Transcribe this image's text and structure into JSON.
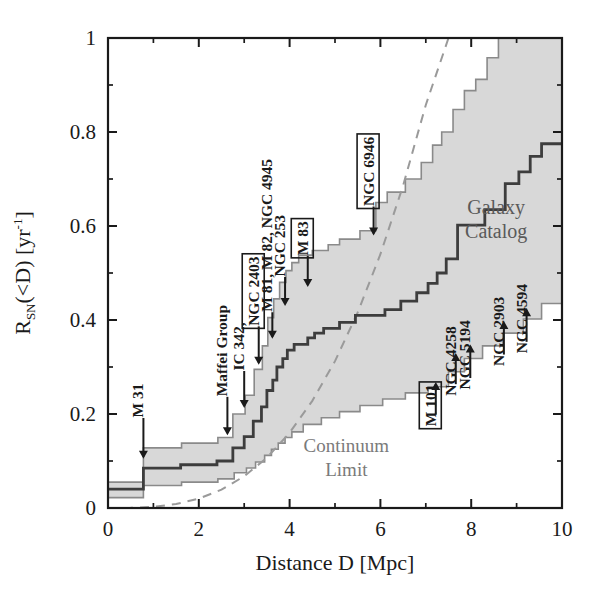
{
  "chart_data": {
    "type": "line",
    "title": "",
    "xlabel": "Distance D [Mpc]",
    "ylabel_parts": {
      "main": "R",
      "subscript": "SN",
      "arg": "(<D)",
      "units_pre": " [yr",
      "units_sup": "-1",
      "units_post": "]"
    },
    "ylabel": "R_SN(<D) [yr^-1]",
    "xlim": [
      0,
      10
    ],
    "ylim": [
      0,
      1
    ],
    "xticks": [
      0,
      2,
      4,
      6,
      8,
      10
    ],
    "xticklabels": [
      "0",
      "2",
      "4",
      "6",
      "8",
      "10"
    ],
    "xminor_step": 1,
    "yticks": [
      0,
      0.2,
      0.4,
      0.6,
      0.8,
      1
    ],
    "yticklabels": [
      "0",
      "0.2",
      "0.4",
      "0.6",
      "0.8",
      "1"
    ],
    "yminor_step": 0.1,
    "grid": false,
    "legend_position": "inline-annotation",
    "series": [
      {
        "name": "Galaxy Catalog",
        "style": "step",
        "color": "#3d3d3d",
        "x": [
          0.0,
          0.78,
          0.78,
          1.6,
          1.6,
          2.4,
          2.4,
          2.75,
          2.75,
          3.0,
          3.0,
          3.2,
          3.2,
          3.38,
          3.38,
          3.5,
          3.5,
          3.63,
          3.63,
          3.72,
          3.72,
          3.85,
          3.85,
          3.95,
          3.95,
          4.1,
          4.1,
          4.4,
          4.4,
          4.55,
          4.55,
          4.75,
          4.75,
          5.1,
          5.1,
          5.45,
          5.45,
          6.1,
          6.1,
          6.45,
          6.45,
          6.8,
          6.8,
          7.05,
          7.05,
          7.25,
          7.25,
          7.45,
          7.45,
          7.7,
          7.7,
          8.3,
          8.3,
          8.75,
          8.75,
          9.05,
          9.05,
          9.3,
          9.3,
          9.55,
          9.55,
          10.0
        ],
        "y": [
          0.04,
          0.04,
          0.085,
          0.085,
          0.092,
          0.092,
          0.1,
          0.1,
          0.128,
          0.128,
          0.152,
          0.152,
          0.185,
          0.185,
          0.215,
          0.215,
          0.25,
          0.25,
          0.272,
          0.272,
          0.3,
          0.3,
          0.318,
          0.318,
          0.336,
          0.336,
          0.348,
          0.348,
          0.362,
          0.362,
          0.372,
          0.372,
          0.382,
          0.382,
          0.395,
          0.395,
          0.41,
          0.41,
          0.422,
          0.422,
          0.44,
          0.44,
          0.458,
          0.458,
          0.478,
          0.478,
          0.5,
          0.5,
          0.53,
          0.53,
          0.602,
          0.602,
          0.635,
          0.635,
          0.69,
          0.69,
          0.715,
          0.715,
          0.748,
          0.748,
          0.775,
          0.775
        ]
      },
      {
        "name": "upper uncertainty bound",
        "style": "step",
        "color": "#8a8a8a",
        "x": [
          0.0,
          0.78,
          0.78,
          1.62,
          1.62,
          2.42,
          2.42,
          2.75,
          2.75,
          3.02,
          3.02,
          3.22,
          3.22,
          3.4,
          3.4,
          3.52,
          3.52,
          3.65,
          3.65,
          3.78,
          3.78,
          3.92,
          3.92,
          4.05,
          4.05,
          4.2,
          4.2,
          4.5,
          4.5,
          4.85,
          4.85,
          5.1,
          5.1,
          5.55,
          5.55,
          5.9,
          5.9,
          6.15,
          6.15,
          6.55,
          6.55,
          6.9,
          6.9,
          7.15,
          7.15,
          7.35,
          7.35,
          7.6,
          7.6,
          7.85,
          7.85,
          8.1,
          8.1,
          8.35,
          8.35,
          8.6,
          8.6,
          10.0
        ],
        "y": [
          0.055,
          0.055,
          0.128,
          0.128,
          0.138,
          0.138,
          0.15,
          0.15,
          0.2,
          0.2,
          0.24,
          0.24,
          0.295,
          0.295,
          0.345,
          0.345,
          0.405,
          0.405,
          0.445,
          0.445,
          0.48,
          0.48,
          0.505,
          0.505,
          0.522,
          0.522,
          0.538,
          0.538,
          0.548,
          0.548,
          0.56,
          0.56,
          0.572,
          0.572,
          0.59,
          0.59,
          0.65,
          0.65,
          0.672,
          0.672,
          0.7,
          0.7,
          0.735,
          0.735,
          0.772,
          0.772,
          0.8,
          0.8,
          0.848,
          0.848,
          0.888,
          0.888,
          0.912,
          0.912,
          0.958,
          0.958,
          1.0,
          1.0
        ]
      },
      {
        "name": "lower uncertainty bound",
        "style": "step",
        "color": "#8a8a8a",
        "x": [
          0.0,
          0.78,
          0.78,
          1.62,
          1.62,
          2.42,
          2.42,
          2.78,
          2.78,
          3.05,
          3.05,
          3.25,
          3.25,
          3.45,
          3.45,
          3.6,
          3.6,
          3.75,
          3.75,
          3.9,
          3.9,
          4.05,
          4.05,
          4.3,
          4.3,
          4.7,
          4.7,
          5.1,
          5.1,
          5.55,
          5.55,
          6.05,
          6.05,
          6.55,
          6.55,
          7.05,
          7.05,
          7.5,
          7.5,
          7.85,
          7.85,
          8.25,
          8.25,
          8.7,
          8.7,
          9.15,
          9.15,
          9.55,
          9.55,
          10.0
        ],
        "y": [
          0.022,
          0.022,
          0.048,
          0.048,
          0.055,
          0.055,
          0.062,
          0.062,
          0.075,
          0.075,
          0.085,
          0.085,
          0.098,
          0.098,
          0.112,
          0.112,
          0.125,
          0.125,
          0.138,
          0.138,
          0.15,
          0.15,
          0.162,
          0.162,
          0.178,
          0.178,
          0.192,
          0.192,
          0.205,
          0.205,
          0.218,
          0.218,
          0.232,
          0.232,
          0.245,
          0.245,
          0.258,
          0.258,
          0.29,
          0.29,
          0.318,
          0.318,
          0.345,
          0.345,
          0.372,
          0.372,
          0.402,
          0.402,
          0.435,
          0.435
        ]
      },
      {
        "name": "Continuum Limit",
        "style": "dashed",
        "color": "#9a9a9a",
        "x": [
          0.0,
          0.5,
          1.0,
          1.5,
          2.0,
          2.5,
          3.0,
          3.5,
          4.0,
          4.5,
          5.0,
          5.5,
          6.0,
          6.5,
          7.0,
          7.5,
          8.0,
          8.3,
          8.6
        ],
        "y": [
          0.0,
          0.0003,
          0.0025,
          0.0084,
          0.02,
          0.039,
          0.0675,
          0.107,
          0.16,
          0.228,
          0.3125,
          0.416,
          0.54,
          0.686,
          0.8575,
          1.0,
          1.0,
          1.0,
          1.0
        ]
      }
    ],
    "band_fill": "#d8d8d8",
    "annotations": [
      {
        "label": "M 31",
        "x": 0.78,
        "boxed": false,
        "group": "left",
        "arrow": "down",
        "tip_y": 0.105,
        "text_y": 0.2,
        "label_x": 0.78
      },
      {
        "label": "Maffei Group",
        "x": 2.75,
        "boxed": false,
        "group": "left",
        "arrow": "down",
        "tip_y": 0.155,
        "text_y": 0.245,
        "label_x": 2.63
      },
      {
        "label": "IC 342,",
        "x": 3.1,
        "boxed": false,
        "group": "left",
        "arrow": "down",
        "tip_y": 0.213,
        "text_y": 0.3,
        "label_x": 3.0
      },
      {
        "label": "NGC 2403",
        "x": 3.4,
        "boxed": true,
        "group": "left",
        "arrow": "down",
        "tip_y": 0.305,
        "text_y": 0.395,
        "label_x": 3.32
      },
      {
        "label": "M 81, M 82, NGC 4945",
        "x": 3.68,
        "boxed": false,
        "group": "left",
        "arrow": "down",
        "tip_y": 0.36,
        "text_y": 0.425,
        "label_x": 3.62
      },
      {
        "label": "NGC 253",
        "x": 3.95,
        "boxed": false,
        "group": "left",
        "arrow": "down",
        "tip_y": 0.43,
        "text_y": 0.5,
        "label_x": 3.9
      },
      {
        "label": "M 83",
        "x": 4.45,
        "boxed": true,
        "group": "left",
        "arrow": "down",
        "tip_y": 0.47,
        "text_y": 0.545,
        "label_x": 4.4
      },
      {
        "label": "NGC 6946",
        "x": 5.92,
        "boxed": true,
        "group": "left",
        "arrow": "down",
        "tip_y": 0.58,
        "text_y": 0.65,
        "label_x": 5.85
      },
      {
        "label": "M 101",
        "x": 7.3,
        "boxed": true,
        "group": "right",
        "arrow": "up",
        "tip_y": 0.268,
        "text_y": 0.19,
        "label_x": 7.22
      },
      {
        "label": "NGC 4258",
        "x": 7.72,
        "boxed": false,
        "group": "right",
        "arrow": "up",
        "tip_y": 0.33,
        "text_y": 0.255,
        "label_x": 7.66
      },
      {
        "label": "NGC 5194",
        "x": 8.04,
        "boxed": false,
        "group": "right",
        "arrow": "up",
        "tip_y": 0.348,
        "text_y": 0.268,
        "label_x": 7.98
      },
      {
        "label": "NGC 2903",
        "x": 8.78,
        "boxed": false,
        "group": "right",
        "arrow": "up",
        "tip_y": 0.398,
        "text_y": 0.318,
        "label_x": 8.72
      },
      {
        "label": "NGC 4594",
        "x": 9.28,
        "boxed": false,
        "group": "right",
        "arrow": "up",
        "tip_y": 0.425,
        "text_y": 0.345,
        "label_x": 9.22
      }
    ],
    "inline_labels": [
      {
        "text_line1": "Galaxy",
        "text_line2": "Catalog",
        "x": 8.55,
        "y": 0.625,
        "color": "#5a5a5a"
      },
      {
        "text_line1": "Continuum",
        "text_line2": "Limit",
        "x": 5.25,
        "y": 0.12,
        "color": "#7a7a7a"
      }
    ]
  }
}
